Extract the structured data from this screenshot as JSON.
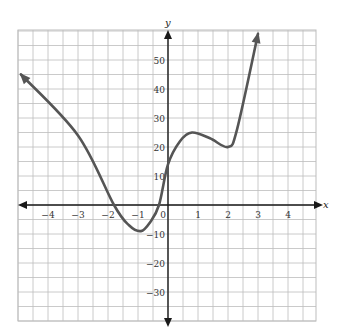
{
  "chart_data": {
    "type": "line",
    "title": "",
    "xlabel": "x",
    "ylabel": "y",
    "xlim": [
      -5,
      5
    ],
    "ylim": [
      -40,
      60
    ],
    "grid": true,
    "x_grid_step": 0.5,
    "y_grid_step": 5,
    "x_ticks": [
      -4,
      -3,
      -2,
      -1,
      0,
      1,
      2,
      3,
      4
    ],
    "x_tick_labels": [
      "−4",
      "−3",
      "−2",
      "−1",
      "0",
      "1",
      "2",
      "3",
      "4"
    ],
    "y_ticks": [
      -30,
      -20,
      -10,
      10,
      20,
      30,
      40,
      50
    ],
    "y_tick_labels": [
      "−30",
      "−20",
      "−10",
      "10",
      "20",
      "30",
      "40",
      "50"
    ],
    "series": [
      {
        "name": "f(x)",
        "color": "#555555",
        "arrow_ends": true,
        "points": [
          {
            "x": -4.9,
            "y": 45
          },
          {
            "x": -3,
            "y": 24
          },
          {
            "x": -1.8,
            "y": 0
          },
          {
            "x": -1.3,
            "y": -7
          },
          {
            "x": -0.9,
            "y": -9
          },
          {
            "x": -0.6,
            "y": -6
          },
          {
            "x": -0.3,
            "y": 0
          },
          {
            "x": 0,
            "y": 14
          },
          {
            "x": 0.4,
            "y": 22
          },
          {
            "x": 0.8,
            "y": 25
          },
          {
            "x": 1.4,
            "y": 23
          },
          {
            "x": 2,
            "y": 20
          },
          {
            "x": 2.3,
            "y": 26
          },
          {
            "x": 3,
            "y": 59
          }
        ]
      }
    ]
  },
  "colors": {
    "grid": "#bdbdbd",
    "axis": "#1a1a1a",
    "curve": "#555555"
  }
}
